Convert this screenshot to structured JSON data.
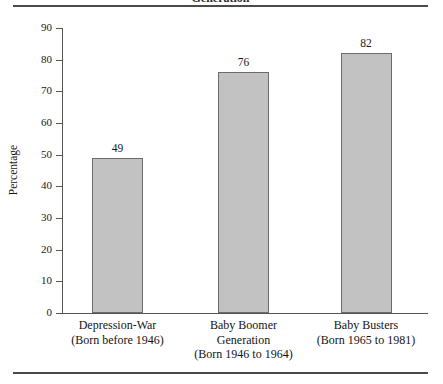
{
  "figure": {
    "rules": [
      "top-rule",
      "bottom-rule"
    ],
    "clipped_title": "Generation"
  },
  "chart_data": {
    "type": "bar",
    "title": "",
    "xlabel": "",
    "ylabel": "Percentage",
    "categories": [
      "Depression-War",
      "Baby Boomer Generation",
      "Baby Busters"
    ],
    "category_lines": [
      [
        "Depression-War",
        "(Born before 1946)"
      ],
      [
        "Baby Boomer",
        "Generation",
        "(Born 1946 to 1964)"
      ],
      [
        "Baby Busters",
        "(Born 1965 to 1981)"
      ]
    ],
    "values": [
      49,
      76,
      82
    ],
    "value_labels": [
      "49",
      "76",
      "82"
    ],
    "ylim": [
      0,
      90
    ],
    "ytick_step": 10,
    "yticks": [
      0,
      10,
      20,
      30,
      40,
      50,
      60,
      70,
      80,
      90
    ],
    "ytick_labels": [
      "0",
      "10",
      "20",
      "30",
      "40",
      "50",
      "60",
      "70",
      "80",
      "90"
    ],
    "grid": false,
    "legend": null,
    "colors": {
      "bar_fill": "#c2c2c2",
      "bar_border": "#6b6b6b",
      "axis": "#555555",
      "rule": "#4a4a4a",
      "text": "#1a1a1a",
      "background": "#ffffff"
    }
  }
}
